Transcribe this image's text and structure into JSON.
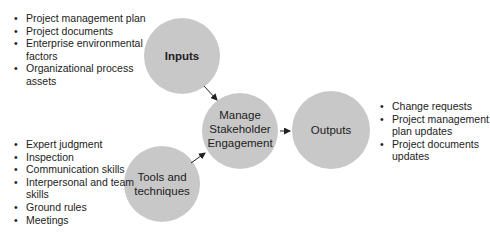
{
  "diagram": {
    "nodes": {
      "inputs": {
        "label_lines": [
          "Inputs"
        ]
      },
      "process": {
        "label_lines": [
          "Manage",
          "Stakeholder",
          "Engagement"
        ]
      },
      "outputs": {
        "label_lines": [
          "Outputs"
        ]
      },
      "tools": {
        "label_lines": [
          "Tools and",
          "techniques"
        ]
      }
    },
    "inputs_list": [
      "Project management plan",
      "Project documents",
      "Enterprise environmental factors",
      "Organizational process assets"
    ],
    "tools_list": [
      "Expert judgment",
      "Inspection",
      "Communication skills",
      "Interpersonal and team skills",
      "Ground rules",
      "Meetings"
    ],
    "outputs_list": [
      "Change requests",
      "Project management plan updates",
      "Project documents updates"
    ],
    "colors": {
      "circle_fill": "#c8c8c8",
      "text": "#222222",
      "arrow": "#222222"
    }
  }
}
